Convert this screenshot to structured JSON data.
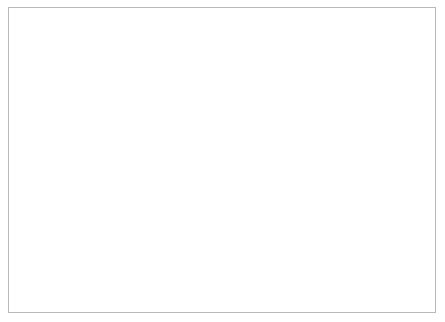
{
  "figure": {
    "background_color": "#ffffff",
    "frame_color": "#b9b9b9",
    "line_color": "#111111"
  },
  "chart_data": {
    "type": "line",
    "title": "",
    "subtitle": "",
    "xlabel": "Year",
    "ylabel": "Exposure relative to 1989",
    "xlim": [
      1940,
      1990
    ],
    "ylim": [
      0.0,
      1.2
    ],
    "grid": false,
    "legend_position": "inline-left",
    "xticks": [
      1940,
      1950,
      1960,
      1970,
      1980,
      1990
    ],
    "xtick_labels": [
      "1940",
      "1950",
      "1960",
      "1970",
      "1980",
      "1990"
    ],
    "yticks": [
      0.0,
      0.2,
      0.4,
      0.6,
      0.8,
      1.0,
      1.2
    ],
    "ytick_labels": [
      "0.0",
      "0.2",
      "0.4",
      "0.6",
      "0.8",
      "1.0",
      "1.2"
    ],
    "annotations": [
      {
        "text": "a",
        "x": 1948.6,
        "y": 0.315
      },
      {
        "text": "b",
        "x": 1948.6,
        "y": 0.222
      }
    ],
    "series": [
      {
        "name": "a",
        "label": "a",
        "style": "solid",
        "x": [
          1949,
          1950,
          1951,
          1952,
          1953,
          1954,
          1955,
          1956,
          1957,
          1958,
          1959,
          1960,
          1961,
          1962,
          1963,
          1964,
          1965,
          1966,
          1967,
          1968,
          1969,
          1970,
          1971,
          1972,
          1973,
          1974,
          1975,
          1976,
          1977,
          1978,
          1979,
          1980,
          1981,
          1982,
          1983,
          1984,
          1985,
          1986,
          1987,
          1988,
          1989
        ],
        "values": [
          0.315,
          0.315,
          0.322,
          0.335,
          0.336,
          0.333,
          0.352,
          0.375,
          0.392,
          0.412,
          0.443,
          0.492,
          0.545,
          0.635,
          0.762,
          0.784,
          0.8,
          0.845,
          0.85,
          0.895,
          0.925,
          0.962,
          1.02,
          1.075,
          1.14,
          1.158,
          1.155,
          1.085,
          1.022,
          1.02,
          1.055,
          1.015,
          0.985,
          0.962,
          0.945,
          0.952,
          0.978,
          1.005,
          1.018,
          1.002,
          1.0
        ]
      },
      {
        "name": "b",
        "label": "b",
        "style": "dotted",
        "x": [
          1949,
          1950,
          1951,
          1952,
          1953,
          1954,
          1955,
          1956,
          1957,
          1958,
          1959,
          1960,
          1961,
          1962,
          1963,
          1964,
          1965,
          1966,
          1967,
          1968,
          1969,
          1970,
          1971,
          1972,
          1973,
          1974,
          1975,
          1976,
          1977,
          1978,
          1979,
          1980,
          1981,
          1982,
          1983,
          1984,
          1985,
          1986,
          1987,
          1988,
          1989
        ],
        "values": [
          0.222,
          0.222,
          0.228,
          0.238,
          0.248,
          0.252,
          0.272,
          0.295,
          0.315,
          0.338,
          0.365,
          0.398,
          0.445,
          0.512,
          0.6,
          0.64,
          0.665,
          0.7,
          0.73,
          0.772,
          0.812,
          0.852,
          0.9,
          0.94,
          0.985,
          1.008,
          0.998,
          0.965,
          0.932,
          0.922,
          0.972,
          0.945,
          0.928,
          0.918,
          0.908,
          0.93,
          0.96,
          0.985,
          1.0,
          0.995,
          1.0
        ]
      }
    ]
  }
}
